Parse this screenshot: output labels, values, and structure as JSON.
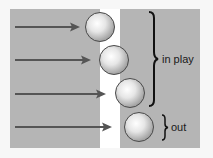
{
  "diagram": {
    "labels": {
      "in_play": "in play",
      "out": "out"
    },
    "colors": {
      "background": "#f7f7f7",
      "panel": "#b5b5b5",
      "gap": "#ffffff",
      "arrow": "#555555",
      "ball_stroke": "#4a4a4a",
      "brace": "#111111"
    },
    "balls": [
      {
        "id": 1,
        "status": "in play"
      },
      {
        "id": 2,
        "status": "in play"
      },
      {
        "id": 3,
        "status": "in play"
      },
      {
        "id": 4,
        "status": "out"
      }
    ],
    "arrows_count": 4
  }
}
